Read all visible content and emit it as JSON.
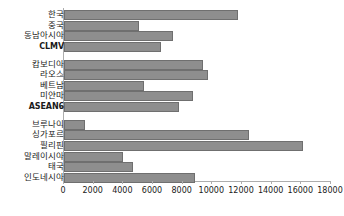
{
  "chart_data": {
    "type": "bar",
    "orientation": "horizontal",
    "title": "",
    "subtitle": "",
    "xlabel": "",
    "ylabel": "",
    "xlim": [
      0,
      18000
    ],
    "xticks": [
      0,
      2000,
      4000,
      6000,
      8000,
      10000,
      12000,
      14000,
      16000,
      18000
    ],
    "xtick_labels": [
      "0",
      "2000",
      "4000",
      "6000",
      "8000",
      "10000",
      "12000",
      "14000",
      "16000",
      "18000"
    ],
    "grid": false,
    "legend": null,
    "bar_color": "#8e8e8e",
    "bar_border_color": "#6f6f6f",
    "axis_color": "#adadad",
    "categories": [
      "한국",
      "중국",
      "동남아시아",
      "CLMV",
      "캄보디아",
      "라오스",
      "베트남",
      "미얀마",
      "ASEAN6",
      "브루나이",
      "싱가포르",
      "필리핀",
      "말레이시아",
      "태국",
      "인도네시아"
    ],
    "values": [
      11700,
      5060,
      7350,
      6540,
      9370,
      9700,
      5400,
      8700,
      7750,
      1400,
      12500,
      16100,
      3950,
      4650,
      8800
    ],
    "bars": [
      {
        "label": "한국",
        "value": 11700,
        "group": 1,
        "script": "hangul"
      },
      {
        "label": "중국",
        "value": 5060,
        "group": 1,
        "script": "hangul"
      },
      {
        "label": "동남아시아",
        "value": 7350,
        "group": 1,
        "script": "hangul"
      },
      {
        "label": "CLMV",
        "value": 6540,
        "group": 1,
        "script": "latin"
      },
      {
        "label": "캄보디아",
        "value": 9370,
        "group": 2,
        "script": "hangul"
      },
      {
        "label": "라오스",
        "value": 9700,
        "group": 2,
        "script": "hangul"
      },
      {
        "label": "베트남",
        "value": 5400,
        "group": 2,
        "script": "hangul"
      },
      {
        "label": "미얀마",
        "value": 8700,
        "group": 2,
        "script": "hangul"
      },
      {
        "label": "ASEAN6",
        "value": 7750,
        "group": 2,
        "script": "latin"
      },
      {
        "label": "브루나이",
        "value": 1400,
        "group": 3,
        "script": "hangul"
      },
      {
        "label": "싱가포르",
        "value": 12500,
        "group": 3,
        "script": "hangul"
      },
      {
        "label": "필리핀",
        "value": 16100,
        "group": 3,
        "script": "hangul"
      },
      {
        "label": "말레이시아",
        "value": 3950,
        "group": 3,
        "script": "hangul"
      },
      {
        "label": "태국",
        "value": 4650,
        "group": 3,
        "script": "hangul"
      },
      {
        "label": "인도네시아",
        "value": 8800,
        "group": 3,
        "script": "hangul"
      }
    ]
  }
}
